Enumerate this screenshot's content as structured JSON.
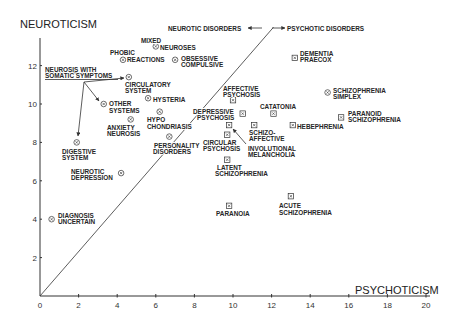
{
  "chart_data": {
    "type": "scatter",
    "title": "",
    "xlabel": "PSYCHOTICISM",
    "ylabel": "NEUROTICISM",
    "xlim": [
      0,
      20
    ],
    "ylim": [
      0,
      14
    ],
    "x_ticks": [
      0,
      2,
      4,
      6,
      8,
      10,
      12,
      14,
      16,
      18,
      20
    ],
    "y_ticks": [
      2,
      4,
      6,
      8,
      10,
      12
    ],
    "grid": false,
    "legend": null,
    "divider_line": {
      "from": [
        0,
        0
      ],
      "to": [
        12.1,
        14.0
      ]
    },
    "annotations": {
      "neurotic_side": "NEUROTIC DISORDERS",
      "psychotic_side": "PSYCHOTIC DISORDERS",
      "somatic_group": [
        "NEUROSIS WITH",
        "SOMATIC SYMPTOMS"
      ]
    },
    "series": [
      {
        "name": "Neurotic disorders",
        "marker": "circled-x",
        "points": [
          {
            "label": "Mixed neuroses",
            "lines": [
              "MIXED",
              "NEUROSES"
            ],
            "x": 6.0,
            "y": 13.0
          },
          {
            "label": "Phobic reactions",
            "lines": [
              "PHOBIC",
              "REACTIONS"
            ],
            "x": 4.3,
            "y": 12.3
          },
          {
            "label": "Obsessive compulsive",
            "lines": [
              "OBSESSIVE",
              "COMPULSIVE"
            ],
            "x": 7.0,
            "y": 12.3
          },
          {
            "label": "Circulatory system",
            "lines": [
              "CIRCULATORY",
              "SYSTEM"
            ],
            "x": 4.6,
            "y": 11.4
          },
          {
            "label": "Hysteria",
            "lines": [
              "HYSTERIA"
            ],
            "x": 5.6,
            "y": 10.3
          },
          {
            "label": "Other systems",
            "lines": [
              "OTHER",
              "SYSTEMS"
            ],
            "x": 3.3,
            "y": 10.0
          },
          {
            "label": "Anxiety neurosis",
            "lines": [
              "ANXIETY",
              "NEUROSIS"
            ],
            "x": 4.7,
            "y": 9.2
          },
          {
            "label": "Hypochondriasis",
            "lines": [
              "HYPO",
              "CHONDRIASIS"
            ],
            "x": 6.2,
            "y": 9.6
          },
          {
            "label": "Personality disorders",
            "lines": [
              "PERSONALITY",
              "DISORDERS"
            ],
            "x": 6.7,
            "y": 8.3
          },
          {
            "label": "Digestive system",
            "lines": [
              "DIGESTIVE",
              "SYSTEM"
            ],
            "x": 1.9,
            "y": 8.0
          },
          {
            "label": "Neurotic depression",
            "lines": [
              "NEUROTIC",
              "DEPRESSION"
            ],
            "x": 4.2,
            "y": 6.4
          },
          {
            "label": "Diagnosis uncertain",
            "lines": [
              "DIAGNOSIS",
              "UNCERTAIN"
            ],
            "x": 0.6,
            "y": 4.0
          }
        ]
      },
      {
        "name": "Psychotic disorders",
        "marker": "boxed-x",
        "points": [
          {
            "label": "Dementia praecox",
            "lines": [
              "DEMENTIA",
              "PRAECOX"
            ],
            "x": 13.2,
            "y": 12.4
          },
          {
            "label": "Schizophrenia simplex",
            "lines": [
              "SCHIZOPHRENIA",
              "SIMPLEX"
            ],
            "x": 14.9,
            "y": 10.6
          },
          {
            "label": "Paranoid schizophrenia",
            "lines": [
              "PARANOID",
              "SCHIZOPHRENIA"
            ],
            "x": 15.6,
            "y": 9.3
          },
          {
            "label": "Affective psychosis",
            "lines": [
              "AFFECTIVE",
              "PSYCHOSIS"
            ],
            "x": 10.0,
            "y": 10.2
          },
          {
            "label": "Depressive psychosis",
            "lines": [
              "DEPRESSIVE",
              "PSYCHOSIS"
            ],
            "x": 10.5,
            "y": 9.5
          },
          {
            "label": "Catatonia",
            "lines": [
              "CATATONIA"
            ],
            "x": 12.1,
            "y": 9.5
          },
          {
            "label": "Involutional melancholia",
            "lines": [
              "INVOLUTIONAL",
              "MELANCHOLIA"
            ],
            "x": 9.8,
            "y": 8.9
          },
          {
            "label": "Schizo-affective",
            "lines": [
              "SCHIZO-",
              "AFFECTIVE"
            ],
            "x": 11.1,
            "y": 8.9
          },
          {
            "label": "Hebephrenia",
            "lines": [
              "HEBEPHRENIA"
            ],
            "x": 13.1,
            "y": 8.9
          },
          {
            "label": "Circular psychosis",
            "lines": [
              "CIRCULAR",
              "PSYCHOSIS"
            ],
            "x": 9.7,
            "y": 8.4
          },
          {
            "label": "Latent schizophrenia",
            "lines": [
              "LATENT",
              "SCHIZOPHRENIA"
            ],
            "x": 9.7,
            "y": 7.1
          },
          {
            "label": "Paranoia",
            "lines": [
              "PARANOIA"
            ],
            "x": 9.8,
            "y": 4.7
          },
          {
            "label": "Acute schizophrenia",
            "lines": [
              "ACUTE",
              "SCHIZOPHRENIA"
            ],
            "x": 13.0,
            "y": 5.2
          }
        ]
      }
    ]
  }
}
